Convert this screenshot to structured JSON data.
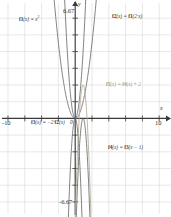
{
  "chart_data": {
    "type": "line",
    "title": "",
    "xlabel": "x",
    "ylabel": "y",
    "xlim": [
      -10,
      10
    ],
    "ylim": [
      -6.67,
      6.67
    ],
    "grid": true,
    "legend": "inline-annotations",
    "xticks": [
      "-10",
      "10"
    ],
    "yticks": [
      "6.67",
      "-6.67"
    ],
    "origin_label": "0",
    "series": [
      {
        "name": "f1",
        "expression": "f1(x) = x²",
        "color": "#6b6b6b",
        "a": 1,
        "h": 0,
        "k": 0
      },
      {
        "name": "f2",
        "expression": "f2(x) = f1(2·x)",
        "color": "#6b6b6b",
        "a": 4,
        "h": 0,
        "k": 0
      },
      {
        "name": "f3",
        "expression": "f3(x) = -2·f2(x)",
        "color": "#6b6b6b",
        "a": -8,
        "h": 0,
        "k": 0
      },
      {
        "name": "f4",
        "expression": "f4(x) = f3(x - 1)",
        "color": "#6b6b6b",
        "a": -8,
        "h": 1,
        "k": 0
      },
      {
        "name": "f5",
        "expression": "f5(x) = f4(x) + 2",
        "color": "#b3ab93",
        "a": -8,
        "h": 1,
        "k": 2
      }
    ]
  },
  "axes": {
    "x_axis_label": "x",
    "y_axis_label": "y",
    "x_min_label": "-10",
    "x_max_label": "10",
    "y_max_label": "6.67",
    "y_min_label": "-6.67",
    "origin_label": "0"
  },
  "annotations": {
    "f1": {
      "fn": "f1",
      "body": "(x) = x",
      "exp": "2"
    },
    "f2": {
      "fn": "f2",
      "body": "(x) = ",
      "fn2": "f1",
      "body2": "(2·x)"
    },
    "f3": {
      "fn": "f3",
      "body": "(x) = −2·",
      "fn2": "f2",
      "body2": "(x)"
    },
    "f4": {
      "fn": "f4",
      "body": "(x) = ",
      "fn2": "f3",
      "body2": "(x − 1)"
    },
    "f5": {
      "fn": "f5",
      "body": "(x) = ",
      "fn2": "f4",
      "body2": "(x) + 2"
    }
  },
  "colors": {
    "grid": "#d8d8d8",
    "axis": "#3a3a3a",
    "curve": "#6b6b6b",
    "curve_light": "#b3ab93",
    "background": "#ffffff"
  }
}
